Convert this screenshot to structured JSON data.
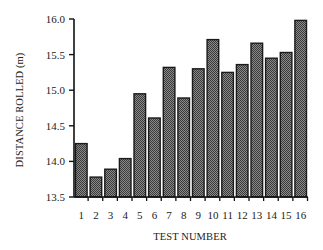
{
  "chart_data": {
    "type": "bar",
    "title": "",
    "xlabel": "TEST NUMBER",
    "ylabel": "DISTANCE ROLLED (m)",
    "ylim": [
      13.5,
      16.0
    ],
    "yticks": [
      13.5,
      14.0,
      14.5,
      15.0,
      15.5,
      16.0
    ],
    "ytick_labels": [
      "13.5",
      "14.0",
      "14.5",
      "15.0",
      "15.5",
      "16.0"
    ],
    "categories": [
      "1",
      "2",
      "3",
      "4",
      "5",
      "6",
      "7",
      "8",
      "9",
      "10",
      "11",
      "12",
      "13",
      "14",
      "15",
      "16"
    ],
    "values": [
      14.25,
      13.78,
      13.89,
      14.04,
      14.95,
      14.61,
      15.32,
      14.89,
      15.3,
      15.71,
      15.25,
      15.36,
      15.66,
      15.45,
      15.53,
      15.98
    ],
    "grid": false,
    "legend": null,
    "bar_fill": "#6e6e6e",
    "bar_edge": "#1a1a1a"
  }
}
